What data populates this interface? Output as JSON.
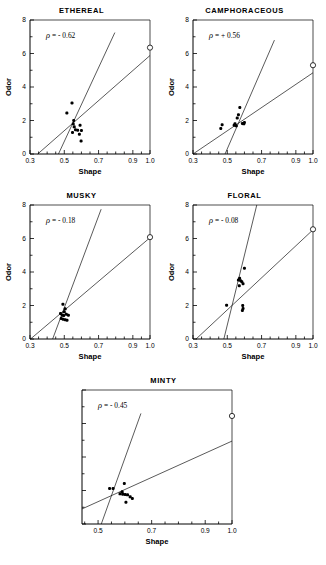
{
  "figure": {
    "axis_x_label": "Shape",
    "axis_y_label": "Odor",
    "x_ticks_major": [
      "0.3",
      "0.5",
      "0.7",
      "0.9",
      "1.0"
    ],
    "y_ticks_major": [
      "0",
      "2",
      "4",
      "6",
      "8"
    ]
  },
  "chart_data": [
    {
      "type": "scatter",
      "title": "ETHEREAL",
      "annotation": "ρ = - 0.62",
      "rho": -0.62,
      "xlabel": "Shape",
      "ylabel": "Odor",
      "xlim": [
        0.3,
        1.0
      ],
      "ylim": [
        0,
        8
      ],
      "xticks": [
        0.3,
        0.5,
        0.7,
        0.9,
        1.0
      ],
      "yticks": [
        0,
        2,
        4,
        6,
        8
      ],
      "grid": false,
      "points": [
        [
          0.545,
          3.05
        ],
        [
          0.515,
          2.45
        ],
        [
          0.555,
          2.0
        ],
        [
          0.552,
          1.8
        ],
        [
          0.558,
          1.62
        ],
        [
          0.592,
          1.72
        ],
        [
          0.565,
          1.45
        ],
        [
          0.578,
          1.42
        ],
        [
          0.6,
          1.4
        ],
        [
          0.548,
          1.28
        ],
        [
          0.588,
          1.18
        ],
        [
          0.598,
          0.78
        ]
      ],
      "reference_point": [
        1.0,
        6.35
      ],
      "fit_lines": [
        {
          "name": "steep-line",
          "p1": [
            0.466,
            0.0
          ],
          "p2": [
            0.795,
            7.25
          ]
        },
        {
          "name": "shallow-line",
          "p1": [
            0.345,
            0.0
          ],
          "p2": [
            1.0,
            5.88
          ]
        }
      ]
    },
    {
      "type": "scatter",
      "title": "CAMPHORACEOUS",
      "annotation": "ρ = + 0.56",
      "rho": 0.56,
      "xlabel": "Shape",
      "ylabel": "Odor",
      "xlim": [
        0.3,
        1.0
      ],
      "ylim": [
        0,
        8
      ],
      "xticks": [
        0.3,
        0.5,
        0.7,
        0.9,
        1.0
      ],
      "yticks": [
        0,
        2,
        4,
        6,
        8
      ],
      "grid": false,
      "points": [
        [
          0.573,
          2.78
        ],
        [
          0.565,
          2.35
        ],
        [
          0.558,
          2.15
        ],
        [
          0.545,
          1.8
        ],
        [
          0.54,
          1.72
        ],
        [
          0.552,
          1.68
        ],
        [
          0.588,
          1.82
        ],
        [
          0.596,
          1.8
        ],
        [
          0.6,
          1.88
        ],
        [
          0.47,
          1.75
        ],
        [
          0.462,
          1.52
        ]
      ],
      "reference_point": [
        1.0,
        5.3
      ],
      "fit_lines": [
        {
          "name": "steep-line",
          "p1": [
            0.487,
            0.0
          ],
          "p2": [
            0.775,
            6.8
          ]
        },
        {
          "name": "shallow-line",
          "p1": [
            0.3,
            0.0
          ],
          "p2": [
            1.0,
            4.85
          ]
        }
      ]
    },
    {
      "type": "scatter",
      "title": "MUSKY",
      "annotation": "ρ = - 0.18",
      "rho": -0.18,
      "xlabel": "Shape",
      "ylabel": "Odor",
      "xlim": [
        0.3,
        1.0
      ],
      "ylim": [
        0,
        8
      ],
      "xticks": [
        0.3,
        0.5,
        0.7,
        0.9,
        1.0
      ],
      "yticks": [
        0,
        2,
        4,
        6,
        8
      ],
      "grid": false,
      "points": [
        [
          0.492,
          2.08
        ],
        [
          0.505,
          1.8
        ],
        [
          0.5,
          1.62
        ],
        [
          0.478,
          1.52
        ],
        [
          0.488,
          1.42
        ],
        [
          0.497,
          1.4
        ],
        [
          0.512,
          1.48
        ],
        [
          0.524,
          1.42
        ],
        [
          0.482,
          1.22
        ],
        [
          0.493,
          1.18
        ],
        [
          0.505,
          1.15
        ],
        [
          0.516,
          1.12
        ]
      ],
      "reference_point": [
        1.0,
        6.08
      ],
      "fit_lines": [
        {
          "name": "steep-line",
          "p1": [
            0.432,
            0.0
          ],
          "p2": [
            0.715,
            7.75
          ]
        },
        {
          "name": "shallow-line",
          "p1": [
            0.303,
            0.0
          ],
          "p2": [
            1.0,
            6.05
          ]
        }
      ]
    },
    {
      "type": "scatter",
      "title": "FLORAL",
      "annotation": "ρ = - 0.08",
      "rho": -0.08,
      "xlabel": "Shape",
      "ylabel": "Odor",
      "xlim": [
        0.3,
        1.0
      ],
      "ylim": [
        0,
        8
      ],
      "xticks": [
        0.3,
        0.5,
        0.7,
        0.9,
        1.0
      ],
      "yticks": [
        0,
        2,
        4,
        6,
        8
      ],
      "grid": false,
      "points": [
        [
          0.6,
          4.22
        ],
        [
          0.572,
          3.62
        ],
        [
          0.565,
          3.52
        ],
        [
          0.578,
          3.48
        ],
        [
          0.585,
          3.42
        ],
        [
          0.592,
          3.3
        ],
        [
          0.57,
          3.18
        ],
        [
          0.496,
          2.02
        ],
        [
          0.59,
          2.0
        ],
        [
          0.592,
          1.82
        ],
        [
          0.588,
          1.7
        ]
      ],
      "reference_point": [
        1.0,
        6.55
      ],
      "fit_lines": [
        {
          "name": "steep-line",
          "p1": [
            0.48,
            0.0
          ],
          "p2": [
            0.672,
            8.0
          ]
        },
        {
          "name": "shallow-line",
          "p1": [
            0.318,
            0.0
          ],
          "p2": [
            1.0,
            6.52
          ]
        }
      ]
    },
    {
      "type": "scatter",
      "title": "MINTY",
      "annotation": "ρ = - 0.45",
      "rho": -0.45,
      "xlabel": "Shape",
      "ylabel": "Odor",
      "xlim": [
        0.44,
        1.0
      ],
      "ylim": [
        0,
        8
      ],
      "xticks": [
        0.5,
        0.7,
        0.9,
        1.0
      ],
      "yticks": [
        0,
        2,
        4,
        6,
        8
      ],
      "grid": false,
      "points": [
        [
          0.598,
          2.42
        ],
        [
          0.543,
          2.12
        ],
        [
          0.556,
          2.12
        ],
        [
          0.59,
          1.92
        ],
        [
          0.582,
          1.8
        ],
        [
          0.592,
          1.78
        ],
        [
          0.601,
          1.76
        ],
        [
          0.61,
          1.74
        ],
        [
          0.62,
          1.62
        ],
        [
          0.628,
          1.52
        ],
        [
          0.604,
          1.3
        ]
      ],
      "reference_point": [
        1.0,
        6.45
      ],
      "fit_lines": [
        {
          "name": "steep-line",
          "p1": [
            0.512,
            0.0
          ],
          "p2": [
            0.66,
            6.6
          ]
        },
        {
          "name": "shallow-line",
          "p1": [
            0.44,
            0.9
          ],
          "p2": [
            1.0,
            4.95
          ]
        }
      ]
    }
  ]
}
